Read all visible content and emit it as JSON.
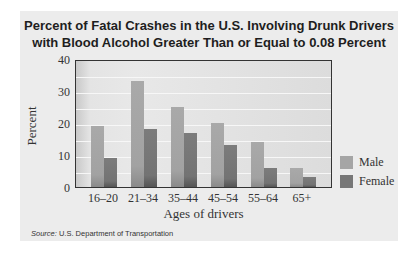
{
  "chart_data": {
    "type": "bar",
    "title": "Percent of Fatal Crashes in the U.S. Involving Drunk Drivers with Blood Alcohol Greater Than or Equal to 0.08 Percent",
    "title_lines": [
      "Percent of Fatal Crashes in the U.S. Involving Drunk Drivers",
      "with Blood Alcohol Greater Than or Equal to 0.08 Percent"
    ],
    "xlabel": "Ages of drivers",
    "ylabel": "Percent",
    "categories": [
      "16–20",
      "21–34",
      "35–44",
      "45–54",
      "55–64",
      "65+"
    ],
    "series": [
      {
        "name": "Male",
        "values": [
          19,
          33,
          25,
          20,
          14,
          6
        ],
        "color": "#a5a5a5"
      },
      {
        "name": "Female",
        "values": [
          9,
          18,
          17,
          13,
          6,
          3
        ],
        "color": "#777777"
      }
    ],
    "ylim": [
      0,
      40
    ],
    "yticks": [
      0,
      10,
      20,
      30,
      40
    ],
    "grid": true,
    "legend_position": "right"
  },
  "source": {
    "label": "Source:",
    "text": "U.S. Department of Transportation"
  }
}
